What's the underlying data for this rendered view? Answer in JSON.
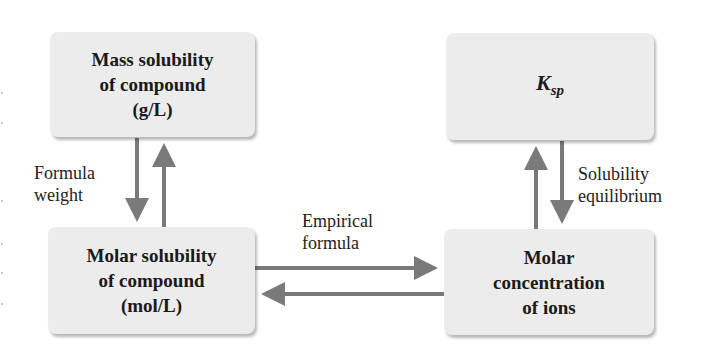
{
  "diagram": {
    "nodes": {
      "mass_solubility": {
        "lines": [
          "Mass solubility",
          "of compound",
          "(g/L)"
        ]
      },
      "ksp": {
        "symbol": "K",
        "subscript": "sp"
      },
      "molar_solubility": {
        "lines": [
          "Molar solubility",
          "of compound",
          "(mol/L)"
        ]
      },
      "molar_concentration": {
        "lines": [
          "Molar",
          "concentration",
          "of ions"
        ]
      }
    },
    "edge_labels": {
      "formula_weight": [
        "Formula",
        "weight"
      ],
      "solubility_equilibrium": [
        "Solubility",
        "equilibrium"
      ],
      "empirical_formula": [
        "Empirical",
        "formula"
      ]
    },
    "edges": [
      {
        "from": "mass_solubility",
        "to": "molar_solubility",
        "label": "formula_weight"
      },
      {
        "from": "molar_solubility",
        "to": "mass_solubility",
        "label": "formula_weight"
      },
      {
        "from": "ksp",
        "to": "molar_concentration",
        "label": "solubility_equilibrium"
      },
      {
        "from": "molar_concentration",
        "to": "ksp",
        "label": "solubility_equilibrium"
      },
      {
        "from": "molar_solubility",
        "to": "molar_concentration",
        "label": "empirical_formula"
      },
      {
        "from": "molar_concentration",
        "to": "molar_solubility",
        "label": "empirical_formula"
      }
    ],
    "colors": {
      "box_fill": "#ececec",
      "arrow": "#7a7a7a",
      "text": "#1a1a1a"
    }
  }
}
